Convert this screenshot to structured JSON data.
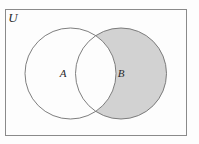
{
  "figure": {
    "kind": "venn-diagram",
    "canvas": {
      "width": 199,
      "height": 144,
      "background": "#fdfdfd"
    }
  },
  "universe": {
    "label": "U",
    "label_x": 13,
    "label_y": 22,
    "rect": {
      "x": 5,
      "y": 9,
      "width": 182,
      "height": 127
    },
    "stroke": "#8a8a8a",
    "stroke_width": 1,
    "fill": "#fdfdfd"
  },
  "sets": [
    {
      "name": "set-a",
      "label": "A",
      "label_x": 63,
      "label_y": 77,
      "cx": 70.5,
      "cy": 73.5,
      "r": 45.5,
      "fill": "#ffffff",
      "stroke": "#6f6f6f",
      "stroke_width": 0.9,
      "shaded": "false"
    },
    {
      "name": "set-b",
      "label": "B",
      "label_x": 121,
      "label_y": 77,
      "cx": 121.0,
      "cy": 73.5,
      "r": 45.5,
      "fill": "#d2d2d2",
      "stroke": "#6f6f6f",
      "stroke_width": 0.9,
      "shaded": "true"
    }
  ],
  "shading": {
    "region": "B minus A",
    "shaded_color": "#d2d2d2",
    "unshaded_color": "#ffffff",
    "intersection_shaded": "false"
  }
}
